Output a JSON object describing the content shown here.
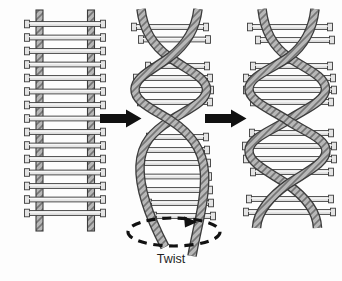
{
  "figure": {
    "twist_label": "Twist",
    "stages": [
      {
        "name": "straight-ladder"
      },
      {
        "name": "partially-twisted-ladder"
      },
      {
        "name": "twisted-double-helix"
      }
    ],
    "icons": {
      "step_arrow_1": "right-arrow-icon",
      "step_arrow_2": "right-arrow-icon",
      "twist_rotation": "dashed-rotation-arrow-icon"
    },
    "colors": {
      "background": "#fdfdfd",
      "outline": "#3c3c3c",
      "strand_fill": "#b7b7b7",
      "strand_hatch": "#757575",
      "rung_fill": "#e4e4e4",
      "rung_highlight": "#f8f8f8",
      "arrow": "#111111",
      "label_text": "#1f1f1f"
    }
  }
}
